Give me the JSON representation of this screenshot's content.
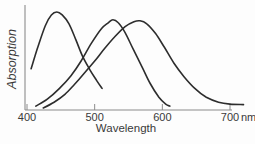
{
  "figure": {
    "y_axis_label": "Absorption",
    "x_axis_label": "Wavelength",
    "x_unit": "nm",
    "x_ticks": [
      400,
      500,
      600,
      700
    ],
    "colors": {
      "curve": "#2d2d2d",
      "axis": "#8c8c8c",
      "text": "#3a3a3a",
      "background": "#fdfdfd"
    }
  },
  "chart_data": {
    "type": "line",
    "title": "",
    "xlabel": "Wavelength",
    "x_unit": "nm",
    "ylabel": "Absorption",
    "xlim": [
      400,
      700
    ],
    "x_ticks": [
      400,
      500,
      600,
      700
    ],
    "ylim": [
      0,
      1
    ],
    "y_ticks": "none (unlabeled relative absorption axis)",
    "grid": false,
    "legend": "none",
    "series": [
      {
        "name": "short-wavelength pigment (peak ~445 nm)",
        "points": [
          [
            406,
            0.42
          ],
          [
            415,
            0.62
          ],
          [
            427,
            0.86
          ],
          [
            436,
            0.97
          ],
          [
            444,
            1.0
          ],
          [
            452,
            0.97
          ],
          [
            462,
            0.88
          ],
          [
            472,
            0.72
          ],
          [
            482,
            0.55
          ],
          [
            493,
            0.41
          ],
          [
            503,
            0.3
          ],
          [
            511,
            0.22
          ]
        ]
      },
      {
        "name": "middle-wavelength pigment (peak ~527 nm)",
        "points": [
          [
            413,
            0.04
          ],
          [
            430,
            0.11
          ],
          [
            448,
            0.22
          ],
          [
            465,
            0.35
          ],
          [
            480,
            0.5
          ],
          [
            495,
            0.68
          ],
          [
            510,
            0.83
          ],
          [
            520,
            0.89
          ],
          [
            527,
            0.92
          ],
          [
            535,
            0.89
          ],
          [
            545,
            0.79
          ],
          [
            557,
            0.62
          ],
          [
            570,
            0.44
          ],
          [
            582,
            0.27
          ],
          [
            595,
            0.13
          ],
          [
            605,
            0.06
          ],
          [
            611,
            0.04
          ]
        ]
      },
      {
        "name": "long-wavelength pigment (peak ~567 nm)",
        "points": [
          [
            424,
            0.02
          ],
          [
            440,
            0.08
          ],
          [
            456,
            0.16
          ],
          [
            470,
            0.26
          ],
          [
            484,
            0.37
          ],
          [
            500,
            0.5
          ],
          [
            515,
            0.63
          ],
          [
            530,
            0.75
          ],
          [
            545,
            0.85
          ],
          [
            558,
            0.9
          ],
          [
            567,
            0.91
          ],
          [
            577,
            0.88
          ],
          [
            590,
            0.78
          ],
          [
            603,
            0.64
          ],
          [
            617,
            0.48
          ],
          [
            632,
            0.34
          ],
          [
            648,
            0.22
          ],
          [
            665,
            0.13
          ],
          [
            683,
            0.08
          ],
          [
            700,
            0.06
          ],
          [
            720,
            0.055
          ]
        ]
      }
    ]
  }
}
